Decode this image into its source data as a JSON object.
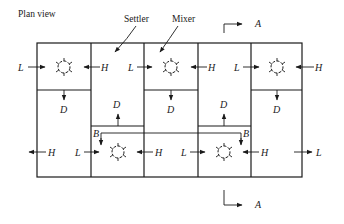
{
  "title": "Plan view",
  "callouts": {
    "settler": "Settler",
    "mixer": "Mixer"
  },
  "section_marker": {
    "top": "A",
    "bottom": "A"
  },
  "streams": {
    "light": "L",
    "heavy": "H",
    "dispersion": "D",
    "bypass": "B"
  },
  "labels": {
    "r1_L1": "L",
    "r1_H1": "H",
    "r1_L2": "L",
    "r1_H2": "H",
    "r1_L3": "L",
    "r1_H3": "H",
    "r1_D1": "D",
    "r1_D2": "D",
    "r1_D3": "D",
    "mid_D_left": "D",
    "mid_D_right": "D",
    "settler_D_left": "D",
    "settler_D_right": "D",
    "B_left": "B",
    "B_right": "B",
    "r2_H_out": "H",
    "r2_L1": "L",
    "r2_H1": "H",
    "r2_L2": "L",
    "r2_H2": "H",
    "r2_L_out": "L"
  }
}
